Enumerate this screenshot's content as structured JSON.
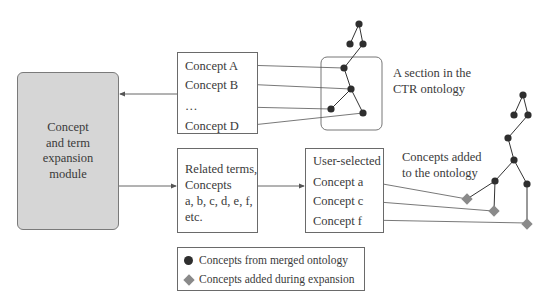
{
  "module": {
    "lines": [
      "Concept",
      "and term",
      "expansion",
      "module"
    ]
  },
  "top_box": {
    "items": [
      "Concept A",
      "Concept B",
      "…",
      "Concept D"
    ]
  },
  "ctr_label": {
    "lines": [
      "A section in the",
      "CTR ontology"
    ]
  },
  "related_box": {
    "lines": [
      "Related terms,",
      "Concepts",
      "a, b, c, d, e, f,",
      "etc."
    ]
  },
  "user_box": {
    "title": "User-selected",
    "items": [
      "Concept a",
      "Concept c",
      "Concept f"
    ]
  },
  "added_label": {
    "lines": [
      "Concepts added",
      "to the ontology"
    ]
  },
  "legend": {
    "items": [
      {
        "symbol": "circle",
        "label": "Concepts from merged ontology"
      },
      {
        "symbol": "diamond",
        "label": "Concepts added during expansion"
      }
    ]
  },
  "colors": {
    "node": "#2e2e2e",
    "added_node": "#8a8a8a",
    "module_fill": "#d6d6d6",
    "line": "#555555"
  }
}
